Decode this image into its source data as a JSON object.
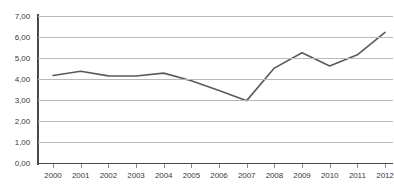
{
  "chart_data": {
    "type": "line",
    "title": "",
    "subtitle": "",
    "xlabel": "",
    "ylabel": "",
    "categories": [
      "2000",
      "2001",
      "2002",
      "2003",
      "2004",
      "2005",
      "2006",
      "2007",
      "2008",
      "2009",
      "2010",
      "2011",
      "2012"
    ],
    "series": [
      {
        "name": "",
        "values": [
          4.17,
          4.37,
          4.15,
          4.14,
          4.28,
          3.92,
          3.45,
          2.97,
          4.52,
          5.25,
          4.62,
          5.15,
          6.22
        ]
      }
    ],
    "ylim": [
      0,
      7
    ],
    "ytick_step": 1,
    "ytick_labels": [
      "0,00",
      "1,00",
      "2,00",
      "3,00",
      "4,00",
      "5,00",
      "6,00",
      "7,00"
    ],
    "ytick_values": [
      0,
      1,
      2,
      3,
      4,
      5,
      6,
      7
    ],
    "xtick_labels": [
      "2000",
      "2001",
      "2002",
      "2003",
      "2004",
      "2005",
      "2006",
      "2007",
      "2008",
      "2009",
      "2010",
      "2011",
      "2012"
    ],
    "grid": true,
    "grid_axis": "y",
    "legend": false,
    "legend_position": "none",
    "markers": false,
    "decimal_separator": ",",
    "colors": {
      "line": "#5a5a5a",
      "grid": "#b9b9b9",
      "axis": "#4a4a4a",
      "tick_label": "#3a3a3a",
      "background": "#ffffff"
    }
  }
}
